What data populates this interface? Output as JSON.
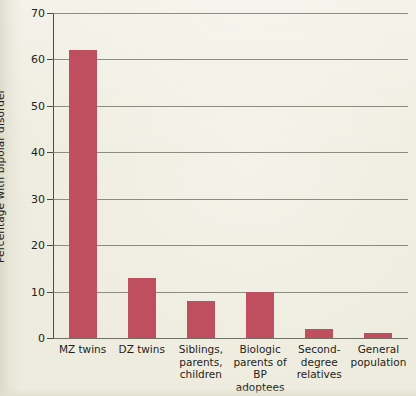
{
  "chart_data": {
    "type": "bar",
    "title": "",
    "xlabel": "",
    "ylabel": "Percentage with bipolar disorder",
    "ylim": [
      0,
      70
    ],
    "ytick_step": 10,
    "yticks": [
      0,
      10,
      20,
      30,
      40,
      50,
      60,
      70
    ],
    "grid": true,
    "legend": null,
    "categories": [
      "MZ twins",
      "DZ twins",
      "Siblings,\nparents,\nchildren",
      "Biologic\nparents of\nBP adoptees",
      "Second-\ndegree\nrelatives",
      "General\npopulation"
    ],
    "values": [
      62,
      13,
      8,
      10,
      2,
      1
    ],
    "series": [
      {
        "name": "Percentage with bipolar disorder",
        "values": [
          62,
          13,
          8,
          10,
          2,
          1
        ]
      }
    ]
  },
  "colors": {
    "bar": "#bf4f5e",
    "background": "#eeecde",
    "gridline": "#7c7a6c",
    "axis": "#4e4c42",
    "text": "#23221c"
  }
}
